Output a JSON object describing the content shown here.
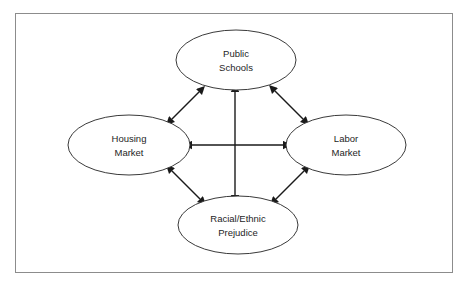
{
  "diagram": {
    "frame": {
      "border_color": "#8c8c8c",
      "background_color": "#ffffff"
    },
    "node_color": "#ffffff",
    "node_stroke_color": "#3a3a3a",
    "arrow_color": "#1a1a1a",
    "text_color": "#1e1e1e",
    "nodes": [
      {
        "id": "public-schools",
        "lines": [
          "Public",
          "Schools"
        ],
        "cx": 236,
        "cy": 60,
        "rx": 60,
        "ry": 30
      },
      {
        "id": "housing-market",
        "lines": [
          "Housing",
          "Market"
        ],
        "cx": 129,
        "cy": 145,
        "rx": 61,
        "ry": 30
      },
      {
        "id": "labor-market",
        "lines": [
          "Labor",
          "Market"
        ],
        "cx": 346,
        "cy": 145,
        "rx": 60,
        "ry": 30
      },
      {
        "id": "racial-ethnic-prejudice",
        "lines": [
          "Racial/Ethnic",
          "Prejudice"
        ],
        "cx": 238,
        "cy": 225,
        "rx": 60,
        "ry": 29
      }
    ],
    "connectors": [
      {
        "id": "housing-to-schools",
        "from": "housing-market",
        "to": "public-schools",
        "direction": "bidirectional",
        "x1": 172,
        "y1": 119,
        "x2": 199,
        "y2": 92
      },
      {
        "id": "schools-to-labor",
        "from": "public-schools",
        "to": "labor-market",
        "direction": "bidirectional",
        "x1": 275,
        "y1": 91,
        "x2": 303,
        "y2": 119
      },
      {
        "id": "housing-to-prejudice",
        "from": "housing-market",
        "to": "racial-ethnic-prejudice",
        "direction": "bidirectional",
        "x1": 172,
        "y1": 171,
        "x2": 200,
        "y2": 199
      },
      {
        "id": "prejudice-to-labor",
        "from": "racial-ethnic-prejudice",
        "to": "labor-market",
        "direction": "bidirectional",
        "x1": 276,
        "y1": 199,
        "x2": 304,
        "y2": 171
      },
      {
        "id": "housing-to-labor",
        "from": "housing-market",
        "to": "labor-market",
        "direction": "bidirectional",
        "x1": 192,
        "y1": 145,
        "x2": 283,
        "y2": 145
      },
      {
        "id": "schools-to-prejudice",
        "from": "public-schools",
        "to": "racial-ethnic-prejudice",
        "direction": "bidirectional",
        "x1": 235,
        "y1": 92,
        "x2": 235,
        "y2": 195
      }
    ]
  }
}
